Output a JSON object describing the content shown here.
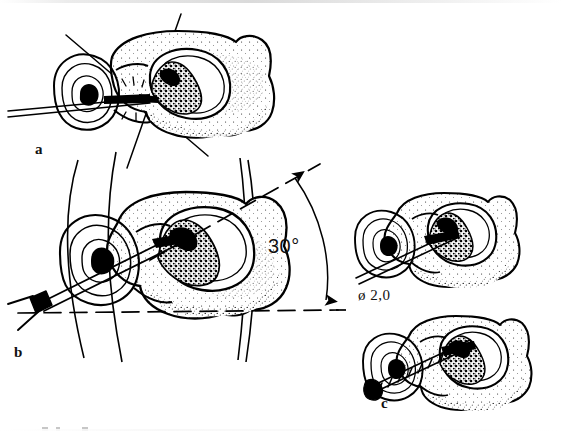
{
  "figure": {
    "kind": "line-drawing",
    "background_color": "#ffffff",
    "ink_color": "#000000"
  },
  "panels": [
    {
      "id": "a",
      "label": "a",
      "caption_text": "a",
      "description": "vertebra in oblique view with needle entering the pedicle; two crossed alignment guide lines intersect at the needle tip"
    },
    {
      "id": "b",
      "label": "b",
      "caption_text": "b",
      "description": "trocar with T-handle advanced through the pedicle into the lesion, angle measured from a horizontal dashed reference line"
    },
    {
      "id": "c",
      "label": "c",
      "caption_text": "c",
      "description": "upper: 2.0 mm drill in place; lower: threaded screw seated through the pedicle into the lesion"
    }
  ],
  "annotations": {
    "angle": {
      "value": "30",
      "unit": "°",
      "text": "30°",
      "panel": "b"
    },
    "diameter": {
      "symbol": "ø",
      "value": "2,0",
      "text": "ø 2,0",
      "panel": "c"
    }
  },
  "colors": {
    "ink": "#000000",
    "paper": "#ffffff",
    "stipple": "#000000"
  }
}
